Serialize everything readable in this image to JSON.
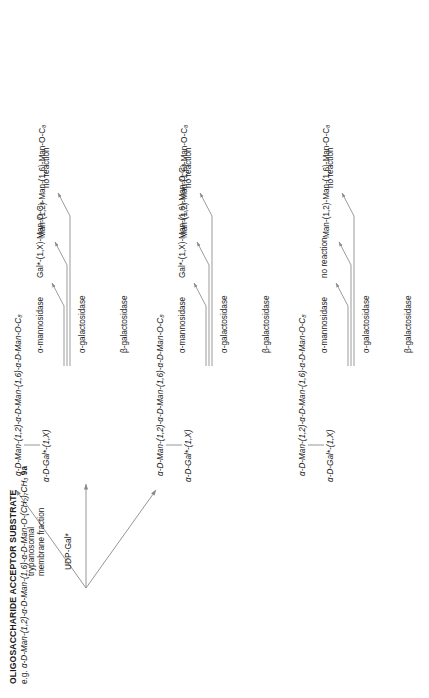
{
  "scheme": {
    "title": "OLIGOSACCHARIDE ACCEPTOR SUBSTRATE",
    "subtitle_prefix": "e.g. ",
    "subtitle_structure": "α-D-Man-(1,2)-α-D-Man-(1,6)-α-D-Man-O-(CH₂)₇CH₃",
    "subtitle_compound": "9a",
    "reagent": "UDP-Gal*",
    "conditions_line1": "trypanosomal",
    "conditions_line2": "membrane fraction",
    "line_color": "#8a8a8a",
    "text_color": "#1a1a1a"
  },
  "branches": [
    {
      "id": "branch-1",
      "product_structure": "α-D-Man-(1,2)-α-D-Man-(1,6)-α-D-Man-O-C₈",
      "attachment": "α-D-Gal*-(1,X)",
      "digestions": [
        {
          "enzyme": "α-mannosidase",
          "product": "Gal*-(1,X)-Man-O-C₈"
        },
        {
          "enzyme": "α-galactosidase",
          "product": "Man-(1,2)-Man-(1,6)-Man-O-C₈"
        },
        {
          "enzyme": "β-galactosidase",
          "product": "no reaction"
        }
      ]
    },
    {
      "id": "branch-2",
      "product_structure": "α-D-Man-(1,2)-α-D-Man-(1,6)-α-D-Man-O-C₈",
      "attachment": "α-D-Gal*-(1,X)",
      "digestions": [
        {
          "enzyme": "α-mannosidase",
          "product": "Gal*-(1,X)-Man-(1,6)-Man-O-C₈"
        },
        {
          "enzyme": "α-galactosidase",
          "product": "Man-(1,2)-Man-(1,6)-Man-O-C₈"
        },
        {
          "enzyme": "β-galactosidase",
          "product": "no reaction"
        }
      ]
    },
    {
      "id": "branch-3",
      "product_structure": "α-D-Man-(1,2)-α-D-Man-(1,6)-α-D-Man-O-C₈",
      "attachment": "α-D-Gal*-(1,X)",
      "digestions": [
        {
          "enzyme": "α-mannosidase",
          "product": "no reaction"
        },
        {
          "enzyme": "α-galactosidase",
          "product": "Man-(1,2)-Man-(1,6)-Man-O-C₈"
        },
        {
          "enzyme": "β-galactosidase",
          "product": "no reaction"
        }
      ]
    }
  ]
}
